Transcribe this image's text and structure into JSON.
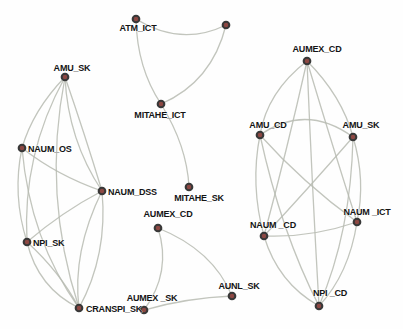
{
  "graph": {
    "background": "#fefefe",
    "edge_color": "#b7bbb1",
    "edge_opacity": 0.85,
    "edge_width": 1.3,
    "node_fill": "#8d4843",
    "node_stroke": "#383838",
    "node_radius": 3.3,
    "label_color": "#141414",
    "nodes": [
      {
        "id": "atm_ict",
        "label": "ATM_ICT",
        "x": 136,
        "y": 19,
        "anchor": "middle",
        "lx": 138,
        "ly": 31
      },
      {
        "id": "unnamed_top",
        "label": "",
        "x": 226,
        "y": 25,
        "anchor": "middle",
        "lx": 226,
        "ly": 14
      },
      {
        "id": "mitahe_ict",
        "label": "MITAHE_ICT",
        "x": 161,
        "y": 104,
        "anchor": "middle",
        "lx": 160,
        "ly": 118
      },
      {
        "id": "mitahe_sk",
        "label": "MITAHE_SK",
        "x": 189,
        "y": 187,
        "anchor": "middle",
        "lx": 199,
        "ly": 201
      },
      {
        "id": "amu_sk_l",
        "label": "AMU_SK",
        "x": 65,
        "y": 77,
        "anchor": "middle",
        "lx": 72,
        "ly": 71
      },
      {
        "id": "naum_os",
        "label": "NAUM_OS",
        "x": 22,
        "y": 148,
        "anchor": "start",
        "lx": 28,
        "ly": 152
      },
      {
        "id": "naum_dss",
        "label": "NAUM_DSS",
        "x": 102,
        "y": 191,
        "anchor": "start",
        "lx": 108,
        "ly": 195
      },
      {
        "id": "npi_sk",
        "label": "NPI_SK",
        "x": 27,
        "y": 242,
        "anchor": "start",
        "lx": 33,
        "ly": 246
      },
      {
        "id": "cranspi_sk",
        "label": "CRANSPI_SK",
        "x": 79,
        "y": 308,
        "anchor": "start",
        "lx": 86,
        "ly": 312
      },
      {
        "id": "aumex_cd_m",
        "label": "AUMEX_CD",
        "x": 158,
        "y": 228,
        "anchor": "middle",
        "lx": 168,
        "ly": 217
      },
      {
        "id": "aumex_sk",
        "label": "AUMEX _SK",
        "x": 144,
        "y": 310,
        "anchor": "middle",
        "lx": 152,
        "ly": 301
      },
      {
        "id": "aunl_sk",
        "label": "AUNL_SK",
        "x": 232,
        "y": 296,
        "anchor": "middle",
        "lx": 239,
        "ly": 289
      },
      {
        "id": "aumex_cd_r",
        "label": "AUMEX_CD",
        "x": 307,
        "y": 61,
        "anchor": "middle",
        "lx": 317,
        "ly": 52
      },
      {
        "id": "amu_cd",
        "label": "AMU_CD",
        "x": 260,
        "y": 135,
        "anchor": "middle",
        "lx": 268,
        "ly": 128
      },
      {
        "id": "amu_sk_r",
        "label": "AMU_SK",
        "x": 353,
        "y": 137,
        "anchor": "middle",
        "lx": 361,
        "ly": 128
      },
      {
        "id": "naum_cd",
        "label": "NAUM _CD",
        "x": 264,
        "y": 236,
        "anchor": "middle",
        "lx": 273,
        "ly": 228
      },
      {
        "id": "naum_ict",
        "label": "NAUM _ICT",
        "x": 357,
        "y": 222,
        "anchor": "middle",
        "lx": 367,
        "ly": 215
      },
      {
        "id": "npi_cd",
        "label": "NPI _CD",
        "x": 319,
        "y": 306,
        "anchor": "middle",
        "lx": 330,
        "ly": 296
      }
    ],
    "edges": [
      {
        "from": "amu_sk_l",
        "to": "naum_os",
        "cx": 33,
        "cy": 110
      },
      {
        "from": "amu_sk_l",
        "to": "naum_dss",
        "cx": 68,
        "cy": 140
      },
      {
        "from": "amu_sk_l",
        "to": "naum_dss",
        "cx": 85,
        "cy": 135
      },
      {
        "from": "amu_sk_l",
        "to": "npi_sk",
        "cx": 22,
        "cy": 155
      },
      {
        "from": "amu_sk_l",
        "to": "cranspi_sk",
        "cx": 42,
        "cy": 195
      },
      {
        "from": "naum_os",
        "to": "naum_dss",
        "cx": 58,
        "cy": 176
      },
      {
        "from": "naum_os",
        "to": "npi_sk",
        "cx": 12,
        "cy": 195
      },
      {
        "from": "naum_os",
        "to": "cranspi_sk",
        "cx": 30,
        "cy": 240
      },
      {
        "from": "naum_dss",
        "to": "npi_sk",
        "cx": 62,
        "cy": 212
      },
      {
        "from": "naum_dss",
        "to": "cranspi_sk",
        "cx": 72,
        "cy": 252
      },
      {
        "from": "naum_dss",
        "to": "cranspi_sk",
        "cx": 108,
        "cy": 255
      },
      {
        "from": "npi_sk",
        "to": "cranspi_sk",
        "cx": 38,
        "cy": 288
      },
      {
        "from": "npi_sk",
        "to": "cranspi_sk",
        "cx": 60,
        "cy": 272
      },
      {
        "from": "atm_ict",
        "to": "unnamed_top",
        "cx": 181,
        "cy": 47
      },
      {
        "from": "atm_ict",
        "to": "mitahe_ict",
        "cx": 137,
        "cy": 68
      },
      {
        "from": "unnamed_top",
        "to": "mitahe_ict",
        "cx": 212,
        "cy": 82
      },
      {
        "from": "mitahe_ict",
        "to": "mitahe_sk",
        "cx": 187,
        "cy": 146
      },
      {
        "from": "aumex_cd_m",
        "to": "aumex_sk",
        "cx": 172,
        "cy": 272
      },
      {
        "from": "aumex_cd_m",
        "to": "aunl_sk",
        "cx": 213,
        "cy": 250
      },
      {
        "from": "aumex_sk",
        "to": "aunl_sk",
        "cx": 186,
        "cy": 298
      },
      {
        "from": "aumex_cd_r",
        "to": "amu_cd",
        "cx": 267,
        "cy": 92
      },
      {
        "from": "aumex_cd_r",
        "to": "amu_sk_r",
        "cx": 342,
        "cy": 96
      },
      {
        "from": "aumex_cd_r",
        "to": "naum_cd",
        "cx": 287,
        "cy": 150
      },
      {
        "from": "aumex_cd_r",
        "to": "naum_ict",
        "cx": 333,
        "cy": 148
      },
      {
        "from": "aumex_cd_r",
        "to": "npi_cd",
        "cx": 312,
        "cy": 185
      },
      {
        "from": "amu_cd",
        "to": "amu_sk_r",
        "cx": 306,
        "cy": 103
      },
      {
        "from": "amu_cd",
        "to": "naum_cd",
        "cx": 250,
        "cy": 185
      },
      {
        "from": "amu_cd",
        "to": "naum_ict",
        "cx": 303,
        "cy": 183
      },
      {
        "from": "amu_cd",
        "to": "npi_cd",
        "cx": 281,
        "cy": 232
      },
      {
        "from": "amu_sk_r",
        "to": "naum_cd",
        "cx": 307,
        "cy": 190
      },
      {
        "from": "amu_sk_r",
        "to": "naum_ict",
        "cx": 366,
        "cy": 180
      },
      {
        "from": "amu_sk_r",
        "to": "npi_cd",
        "cx": 351,
        "cy": 232
      },
      {
        "from": "naum_cd",
        "to": "naum_ict",
        "cx": 310,
        "cy": 238
      },
      {
        "from": "naum_cd",
        "to": "npi_cd",
        "cx": 278,
        "cy": 283
      },
      {
        "from": "naum_ict",
        "to": "npi_cd",
        "cx": 349,
        "cy": 274
      }
    ]
  }
}
